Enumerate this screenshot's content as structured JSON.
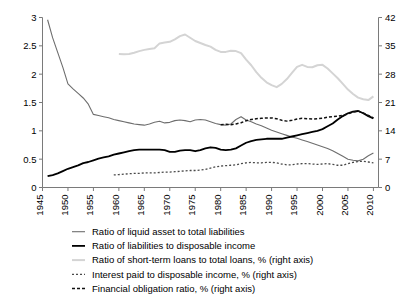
{
  "chart_data": {
    "type": "line",
    "title": "",
    "subtitle": "",
    "xlabel": "",
    "ylabel": "",
    "y2label": "",
    "grid": false,
    "legend_position": "bottom",
    "xlim": [
      1945,
      2011
    ],
    "ylim": [
      0,
      3
    ],
    "y2lim": [
      0,
      42
    ],
    "xticks": [
      1945,
      1950,
      1955,
      1960,
      1965,
      1970,
      1975,
      1980,
      1985,
      1990,
      1995,
      2000,
      2005,
      2010
    ],
    "xtick_labels": [
      "1945",
      "1950",
      "1955",
      "1960",
      "1965",
      "1970",
      "1975",
      "1980",
      "1985",
      "1990",
      "1995",
      "2000",
      "2005",
      "2010"
    ],
    "yticks": [
      0,
      0.5,
      1,
      1.5,
      2,
      2.5,
      3
    ],
    "ytick_labels": [
      "0",
      "0.5",
      "1",
      "1.5",
      "2",
      "2.5",
      "3"
    ],
    "y2ticks": [
      0,
      7,
      14,
      21,
      28,
      35,
      42
    ],
    "y2tick_labels": [
      "0",
      "7",
      "14",
      "21",
      "28",
      "35",
      "42"
    ],
    "series": [
      {
        "name": "Ratio of liquid asset to total liabilities",
        "axis": "left",
        "color": "#6e6e6e",
        "width": 1.1,
        "dash": "none",
        "x": [
          1946,
          1947,
          1948,
          1949,
          1950,
          1951,
          1952,
          1953,
          1954,
          1955,
          1956,
          1957,
          1958,
          1959,
          1960,
          1961,
          1962,
          1963,
          1964,
          1965,
          1966,
          1967,
          1968,
          1969,
          1970,
          1971,
          1972,
          1973,
          1974,
          1975,
          1976,
          1977,
          1978,
          1979,
          1980,
          1981,
          1982,
          1983,
          1984,
          1985,
          1986,
          1987,
          1988,
          1989,
          1990,
          1991,
          1992,
          1993,
          1994,
          1995,
          1996,
          1997,
          1998,
          1999,
          2000,
          2001,
          2002,
          2003,
          2004,
          2005,
          2006,
          2007,
          2008,
          2009,
          2010
        ],
        "y": [
          2.96,
          2.64,
          2.38,
          2.12,
          1.83,
          1.74,
          1.66,
          1.58,
          1.47,
          1.29,
          1.27,
          1.25,
          1.23,
          1.2,
          1.18,
          1.16,
          1.14,
          1.12,
          1.11,
          1.1,
          1.12,
          1.15,
          1.17,
          1.14,
          1.15,
          1.18,
          1.19,
          1.18,
          1.16,
          1.19,
          1.2,
          1.19,
          1.16,
          1.13,
          1.11,
          1.1,
          1.12,
          1.2,
          1.25,
          1.19,
          1.16,
          1.12,
          1.09,
          1.05,
          1.01,
          0.98,
          0.95,
          0.92,
          0.89,
          0.87,
          0.84,
          0.81,
          0.78,
          0.75,
          0.72,
          0.69,
          0.65,
          0.6,
          0.55,
          0.5,
          0.48,
          0.47,
          0.5,
          0.56,
          0.61
        ]
      },
      {
        "name": "Ratio of liabilities to disposable income",
        "axis": "left",
        "color": "#000000",
        "width": 1.8,
        "dash": "none",
        "x": [
          1946,
          1947,
          1948,
          1949,
          1950,
          1951,
          1952,
          1953,
          1954,
          1955,
          1956,
          1957,
          1958,
          1959,
          1960,
          1961,
          1962,
          1963,
          1964,
          1965,
          1966,
          1967,
          1968,
          1969,
          1970,
          1971,
          1972,
          1973,
          1974,
          1975,
          1976,
          1977,
          1978,
          1979,
          1980,
          1981,
          1982,
          1983,
          1984,
          1985,
          1986,
          1987,
          1988,
          1989,
          1990,
          1991,
          1992,
          1993,
          1994,
          1995,
          1996,
          1997,
          1998,
          1999,
          2000,
          2001,
          2002,
          2003,
          2004,
          2005,
          2006,
          2007,
          2008,
          2009,
          2010
        ],
        "y": [
          0.2,
          0.22,
          0.25,
          0.29,
          0.33,
          0.36,
          0.39,
          0.43,
          0.45,
          0.48,
          0.51,
          0.53,
          0.55,
          0.58,
          0.6,
          0.62,
          0.64,
          0.66,
          0.67,
          0.67,
          0.67,
          0.67,
          0.67,
          0.66,
          0.63,
          0.63,
          0.65,
          0.66,
          0.66,
          0.64,
          0.66,
          0.69,
          0.71,
          0.7,
          0.67,
          0.66,
          0.67,
          0.69,
          0.74,
          0.79,
          0.82,
          0.84,
          0.85,
          0.86,
          0.86,
          0.86,
          0.86,
          0.88,
          0.9,
          0.92,
          0.94,
          0.96,
          0.98,
          1.0,
          1.03,
          1.08,
          1.13,
          1.2,
          1.26,
          1.31,
          1.34,
          1.35,
          1.31,
          1.26,
          1.22
        ]
      },
      {
        "name": "Ratio of short-term loans to total loans, % (right axis)",
        "axis": "right",
        "color": "#d4d4d4",
        "width": 2.0,
        "dash": "none",
        "x": [
          1960,
          1961,
          1962,
          1963,
          1964,
          1965,
          1966,
          1967,
          1968,
          1969,
          1970,
          1971,
          1972,
          1973,
          1974,
          1975,
          1976,
          1977,
          1978,
          1979,
          1980,
          1981,
          1982,
          1983,
          1984,
          1985,
          1986,
          1987,
          1988,
          1989,
          1990,
          1991,
          1992,
          1993,
          1994,
          1995,
          1996,
          1997,
          1998,
          1999,
          2000,
          2001,
          2002,
          2003,
          2004,
          2005,
          2006,
          2007,
          2008,
          2009,
          2010
        ],
        "y": [
          33.0,
          32.9,
          33.0,
          33.3,
          33.7,
          34.0,
          34.2,
          34.4,
          35.6,
          35.8,
          36.0,
          36.6,
          37.4,
          37.8,
          37.0,
          36.2,
          35.7,
          35.2,
          34.8,
          34.0,
          33.5,
          33.5,
          33.8,
          33.7,
          33.2,
          31.6,
          30.2,
          28.5,
          27.1,
          26.0,
          25.3,
          24.8,
          25.6,
          26.8,
          28.3,
          29.8,
          30.3,
          29.8,
          29.7,
          30.2,
          30.3,
          29.4,
          28.2,
          27.0,
          25.6,
          24.2,
          23.1,
          22.2,
          21.8,
          21.6,
          22.5
        ]
      },
      {
        "name": "Interest paid to disposable income, % (right axis)",
        "axis": "right",
        "color": "#4a4a4a",
        "width": 1.3,
        "dash": "2,2",
        "x": [
          1959,
          1960,
          1961,
          1962,
          1963,
          1964,
          1965,
          1966,
          1967,
          1968,
          1969,
          1970,
          1971,
          1972,
          1973,
          1974,
          1975,
          1976,
          1977,
          1978,
          1979,
          1980,
          1981,
          1982,
          1983,
          1984,
          1985,
          1986,
          1987,
          1988,
          1989,
          1990,
          1991,
          1992,
          1993,
          1994,
          1995,
          1996,
          1997,
          1998,
          1999,
          2000,
          2001,
          2002,
          2003,
          2004,
          2005,
          2006,
          2007,
          2008,
          2009,
          2010
        ],
        "y": [
          3.1,
          3.2,
          3.3,
          3.4,
          3.5,
          3.5,
          3.6,
          3.6,
          3.6,
          3.7,
          3.8,
          3.8,
          3.9,
          4.0,
          4.1,
          4.2,
          4.2,
          4.3,
          4.5,
          4.8,
          5.1,
          5.3,
          5.4,
          5.5,
          5.6,
          5.9,
          6.1,
          6.2,
          6.1,
          6.1,
          6.2,
          6.2,
          6.1,
          5.8,
          5.6,
          5.6,
          5.8,
          5.9,
          5.9,
          5.8,
          5.7,
          5.8,
          5.9,
          5.7,
          5.5,
          5.5,
          5.9,
          6.2,
          6.4,
          6.5,
          6.3,
          6.1
        ]
      },
      {
        "name": "Financial obligation ratio, % (right axis)",
        "axis": "right",
        "color": "#111111",
        "width": 1.5,
        "dash": "3,2",
        "x": [
          1980,
          1981,
          1982,
          1983,
          1984,
          1985,
          1986,
          1987,
          1988,
          1989,
          1990,
          1991,
          1992,
          1993,
          1994,
          1995,
          1996,
          1997,
          1998,
          1999,
          2000,
          2001,
          2002,
          2003,
          2004,
          2005,
          2006,
          2007,
          2008,
          2009,
          2010
        ],
        "y": [
          15.5,
          15.6,
          15.5,
          15.7,
          16.0,
          16.5,
          16.8,
          17.0,
          17.1,
          17.2,
          17.2,
          17.0,
          16.6,
          16.4,
          16.6,
          16.9,
          17.1,
          17.0,
          16.9,
          17.0,
          17.1,
          17.4,
          17.5,
          17.6,
          17.8,
          18.2,
          18.6,
          18.9,
          18.4,
          17.8,
          17.2
        ]
      }
    ]
  },
  "legend": {
    "items": [
      {
        "label": "Ratio of liquid asset to total liabilities",
        "marker": "solid-gray-line-icon"
      },
      {
        "label": "Ratio of liabilities to disposable income",
        "marker": "solid-black-line-icon"
      },
      {
        "label": "Ratio of short-term loans to total loans, % (right axis)",
        "marker": "solid-lightgray-line-icon"
      },
      {
        "label": "Interest paid to disposable income, % (right axis)",
        "marker": "dashed-gray-line-icon"
      },
      {
        "label": "Financial obligation ratio, % (right axis)",
        "marker": "dashed-black-line-icon"
      }
    ]
  }
}
